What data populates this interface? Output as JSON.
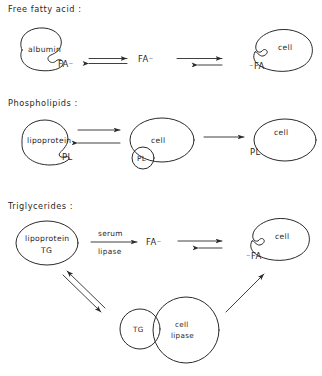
{
  "figure": {
    "background": "#ffffff",
    "ink": "#2a2a2a",
    "sections": [
      {
        "id": "free-fatty-acid",
        "title": "Free fatty acid :",
        "donor_label": "albumin",
        "donor_bound_species": "FA⁻",
        "free_species": "FA⁻",
        "acceptor_label": "cell",
        "acceptor_bound_species": "⁻FA"
      },
      {
        "id": "phospholipids",
        "title": "Phospholipids :",
        "donor_label": "lipoprotein",
        "donor_bound_species": "PL",
        "vesicle_label": "PL",
        "middle_cell_label": "cell",
        "acceptor_label": "cell",
        "acceptor_bound_species": "PL"
      },
      {
        "id": "triglycerides",
        "title": "Triglycerides :",
        "donor_label": "lipoprotein",
        "donor_cargo": "TG",
        "enzyme_line_1": "serum",
        "enzyme_line_2": "lipase",
        "free_species": "FA⁻",
        "acceptor_label": "cell",
        "acceptor_bound_species": "⁻FA",
        "droplet_label": "TG",
        "enzyme_circle_line_1": "cell",
        "enzyme_circle_line_2": "lipase"
      }
    ]
  }
}
